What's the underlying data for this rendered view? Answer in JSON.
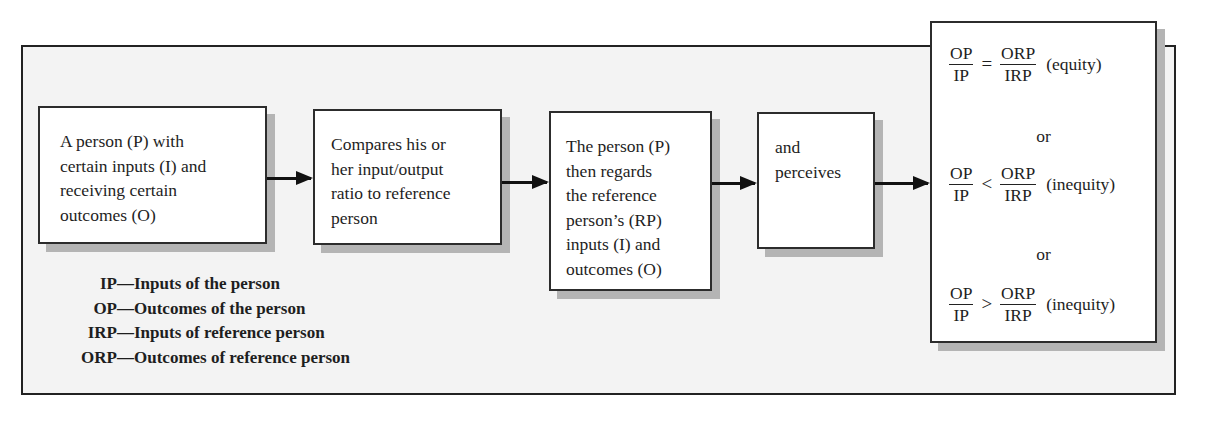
{
  "diagram": {
    "type": "flowchart",
    "boxes": [
      {
        "id": "box1",
        "lines": [
          "A person (P) with",
          "certain inputs (I) and",
          "receiving certain",
          "outcomes (O)"
        ]
      },
      {
        "id": "box2",
        "lines": [
          "Compares his or",
          "her input/output",
          "ratio to reference",
          "person"
        ]
      },
      {
        "id": "box3",
        "lines": [
          "The person (P)",
          "then regards",
          "the reference",
          "person’s (RP)",
          "inputs (I) and",
          "outcomes (O)"
        ]
      },
      {
        "id": "box4",
        "lines": [
          "and",
          "perceives"
        ]
      }
    ],
    "arrows": [
      {
        "from": "box1",
        "to": "box2"
      },
      {
        "from": "box2",
        "to": "box3"
      },
      {
        "from": "box3",
        "to": "box4"
      },
      {
        "from": "box4",
        "to": "box5"
      }
    ],
    "outcomes_box": {
      "equations": [
        {
          "numerator_left": "OP",
          "denominator_left": "IP",
          "operator": "=",
          "numerator_right": "ORP",
          "denominator_right": "IRP",
          "label": "(equity)"
        },
        {
          "numerator_left": "OP",
          "denominator_left": "IP",
          "operator": "<",
          "numerator_right": "ORP",
          "denominator_right": "IRP",
          "label": "(inequity)"
        },
        {
          "numerator_left": "OP",
          "denominator_left": "IP",
          "operator": ">",
          "numerator_right": "ORP",
          "denominator_right": "IRP",
          "label": "(inequity)"
        }
      ],
      "separator": "or"
    },
    "legend": [
      {
        "abbr": "IP",
        "dash": "—",
        "meaning": "Inputs of the person"
      },
      {
        "abbr": "OP",
        "dash": "—",
        "meaning": "Outcomes of the person"
      },
      {
        "abbr": "IRP",
        "dash": "—",
        "meaning": "Inputs of reference person"
      },
      {
        "abbr": "ORP",
        "dash": "—",
        "meaning": "Outcomes of reference person"
      }
    ]
  },
  "colors": {
    "frame_background": "#f3f3f3",
    "box_background": "#ffffff",
    "border": "#2c2c2c",
    "shadow": "#b4b4b4",
    "arrow": "#111111"
  }
}
